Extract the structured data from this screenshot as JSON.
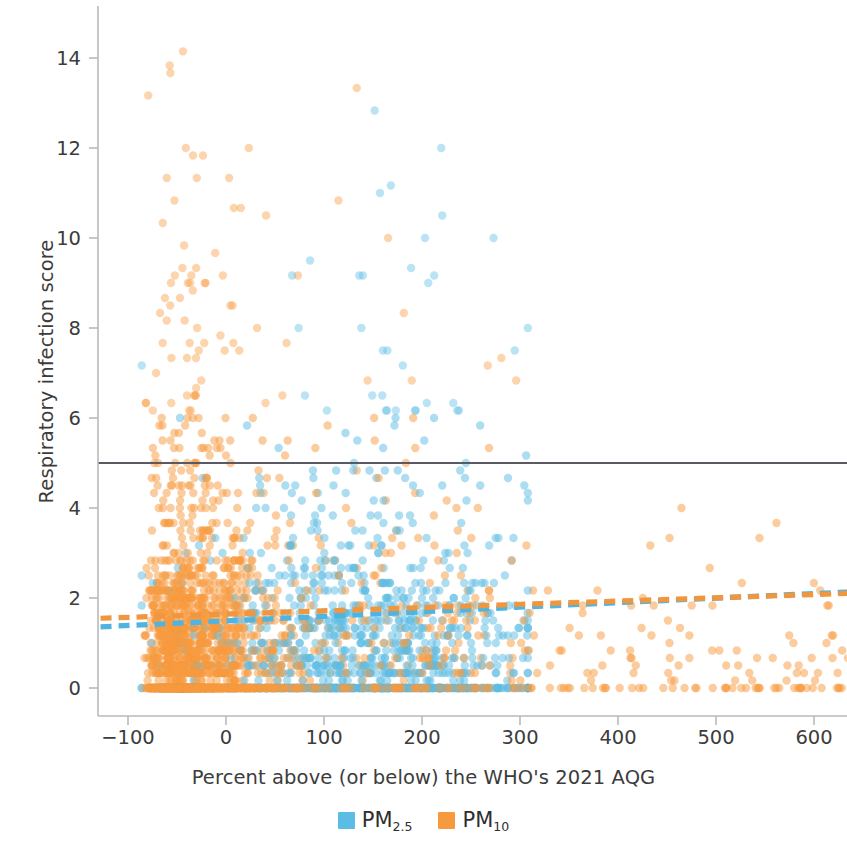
{
  "chart_data": {
    "type": "scatter",
    "title": "",
    "xlabel": "Percent above (or below) the WHO's 2021 AQG",
    "ylabel": "Respiratory infection score",
    "xlim": [
      -130,
      660
    ],
    "ylim": [
      -0.55,
      15.0
    ],
    "xticks": [
      -100,
      0,
      100,
      200,
      300,
      400,
      500,
      600
    ],
    "xtick_labels": [
      "−100",
      "0",
      "100",
      "200",
      "300",
      "400",
      "500",
      "600"
    ],
    "yticks": [
      0,
      2,
      4,
      6,
      8,
      10,
      12,
      14
    ],
    "ytick_labels": [
      "0",
      "2",
      "4",
      "6",
      "8",
      "10",
      "12",
      "14"
    ],
    "grid": false,
    "legend_position": "bottom-center",
    "marker_radius": 4.2,
    "marker_opacity": 0.5,
    "series": [
      {
        "name": "PM2.5",
        "label_main": "PM",
        "label_sub": "2.5",
        "color": "#5BBCE4",
        "n_points": 1100,
        "x_range": [
          -85,
          305
        ],
        "x_mode": 130,
        "trendline": {
          "style": "dashed",
          "color": "#4FB4DF",
          "x0": -128,
          "y0": 1.36,
          "x1": 660,
          "y1": 2.16
        }
      },
      {
        "name": "PM10",
        "label_main": "PM",
        "label_sub": "10",
        "color": "#F79A3E",
        "n_points": 1100,
        "x_range": [
          -92,
          650
        ],
        "x_mode": -20,
        "trendline": {
          "style": "dashed",
          "color": "#F0963F",
          "x0": -128,
          "y0": 1.55,
          "x1": 660,
          "y1": 2.12
        }
      }
    ],
    "reference_lines": [
      {
        "name": "threshold-line",
        "orientation": "horizontal",
        "y": 5.0,
        "color": "#5A5A62",
        "style": "solid",
        "width": 2.2
      }
    ],
    "axis_color": "#b9b9b9",
    "background": "#ffffff"
  },
  "legend": {
    "items": [
      {
        "main": "PM",
        "sub": "2.5",
        "color": "#5BBCE4"
      },
      {
        "main": "PM",
        "sub": "10",
        "color": "#F79A3E"
      }
    ]
  }
}
